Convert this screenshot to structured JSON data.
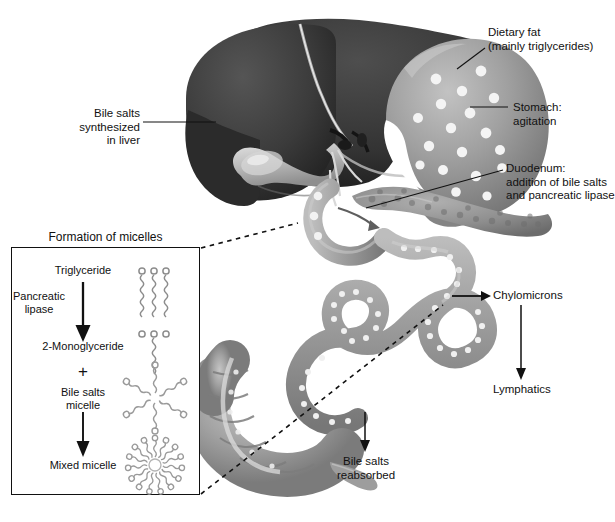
{
  "diagram": {
    "title_hidden": "Digestion and absorption of dietary fat",
    "labels": [
      {
        "id": "dietary-fat",
        "lines": [
          "Dietary fat",
          "(mainly triglycerides)"
        ],
        "x": 488,
        "y": 26,
        "align": "left"
      },
      {
        "id": "stomach",
        "lines": [
          "Stomach:",
          "agitation"
        ],
        "x": 513,
        "y": 102,
        "align": "left"
      },
      {
        "id": "duodenum",
        "lines": [
          "Duodenum:",
          "addition of bile salts",
          "and pancreatic lipase"
        ],
        "x": 506,
        "y": 163,
        "align": "left"
      },
      {
        "id": "bile-salts-liver",
        "lines": [
          "Bile salts",
          "synthesized",
          "in liver"
        ],
        "x": 136,
        "y": 114,
        "align": "right"
      },
      {
        "id": "chylomicrons",
        "lines": [
          "Chylomicrons"
        ],
        "x": 491,
        "y": 290,
        "align": "left"
      },
      {
        "id": "lymphatics",
        "lines": [
          "Lymphatics"
        ],
        "x": 491,
        "y": 384,
        "align": "left"
      },
      {
        "id": "bile-salts-reabsorbed",
        "lines": [
          "Bile salts",
          "reabsorbed"
        ],
        "x": 338,
        "y": 457,
        "align": "left"
      }
    ]
  },
  "inset": {
    "title": "Formation of micelles",
    "steps": [
      {
        "id": "triglyceride",
        "label": "Triglyceride",
        "structure": "triglyceride-3-chain"
      },
      {
        "id": "pancreatic-lipase",
        "label": "Pancreatic\nlipase",
        "structure": "none"
      },
      {
        "id": "monoglyceride",
        "label": "2-Monoglyceride",
        "structure": "monoglyceride-1-chain"
      },
      {
        "id": "plus",
        "label": "+",
        "structure": "none"
      },
      {
        "id": "bile-salts-micelle",
        "label": "Bile salts\nmicelle",
        "structure": "micelle-star"
      },
      {
        "id": "mixed-micelle",
        "label": "Mixed micelle",
        "structure": "mixed-micelle-ring"
      }
    ]
  },
  "colors": {
    "liver": "#3a3a3a",
    "liver_dark": "#262626",
    "gallbladder": "#b9b9b9",
    "stomach": "#8d8d8d",
    "stomach_light": "#b4b4b4",
    "intestine": "#9a9a9a",
    "pancreas": "#8f8f8f",
    "colon": "#a2a2a2",
    "fat_droplet": "#f2f2f2",
    "leader_line": "#111111",
    "dashed_line": "#111111",
    "box_border": "#111111",
    "text": "#111111",
    "molecule": "#8a8a8a",
    "background": "#ffffff"
  }
}
